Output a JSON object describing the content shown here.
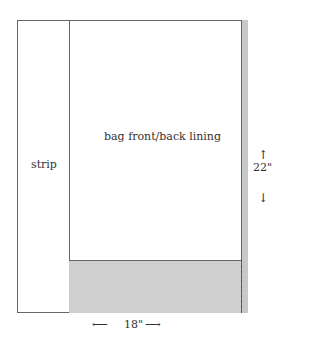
{
  "diagram": {
    "labels": {
      "strip": "strip",
      "main_panel": "bag front/back lining",
      "height_dim": "22\"",
      "width_dim": "18\""
    },
    "arrows": {
      "up": "↑",
      "down": "↓",
      "left": "⟵",
      "right": "⟶"
    },
    "colors": {
      "outline": "#666666",
      "shaded": "#cfcfcf",
      "background": "#ffffff"
    }
  }
}
